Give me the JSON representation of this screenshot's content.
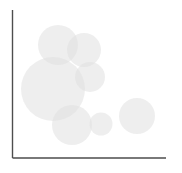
{
  "figure": {
    "width": 182,
    "height": 173,
    "background_color": "#ffffff"
  },
  "axes": {
    "name": "l-shaped-axis-frame",
    "line_color": "#4d4d4d",
    "line_width": 1.4,
    "y_axis": {
      "x": 12.5,
      "y_top": 10,
      "y_bottom": 158
    },
    "x_axis": {
      "y": 158,
      "x_left": 12.5,
      "x_right": 166
    },
    "ticks_visible": false,
    "tick_labels_visible": false,
    "grid": false,
    "x_label": "",
    "y_label": "",
    "title": ""
  },
  "chart_data": {
    "type": "scatter",
    "title": "",
    "xlabel": "",
    "ylabel": "",
    "xlim": [
      0,
      100
    ],
    "ylim": [
      0,
      100
    ],
    "grid": false,
    "legend": false,
    "marker_style": "filled-circle",
    "marker_fill_color": "#e0e0e0",
    "marker_opacity": 0.55,
    "overlap_color": "#a9a9a9",
    "points": [
      {
        "id": "bubble-top",
        "cx": 58,
        "cy": 45,
        "r": 20,
        "x": 29.7,
        "y": 76.4,
        "size": 20
      },
      {
        "id": "bubble-top-right",
        "cx": 84,
        "cy": 50,
        "r": 17,
        "x": 46.6,
        "y": 73.0,
        "size": 17
      },
      {
        "id": "bubble-large-left",
        "cx": 53,
        "cy": 89,
        "r": 32,
        "x": 26.4,
        "y": 46.6,
        "size": 32
      },
      {
        "id": "bubble-mid-right",
        "cx": 90,
        "cy": 77,
        "r": 15,
        "x": 50.5,
        "y": 54.7,
        "size": 15
      },
      {
        "id": "bubble-bottom-mid",
        "cx": 72,
        "cy": 125,
        "r": 20,
        "x": 38.8,
        "y": 22.3,
        "size": 20
      },
      {
        "id": "bubble-bottom-small",
        "cx": 101,
        "cy": 124,
        "r": 11.5,
        "x": 57.6,
        "y": 23.0,
        "size": 11.5
      },
      {
        "id": "bubble-right",
        "cx": 137,
        "cy": 116,
        "r": 18,
        "x": 81.0,
        "y": 28.4,
        "size": 18
      }
    ]
  }
}
